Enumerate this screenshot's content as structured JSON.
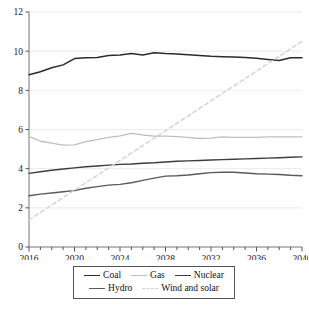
{
  "chart_data": {
    "type": "line",
    "title": "",
    "subtitle": "",
    "xlabel": "",
    "ylabel": "",
    "xlim": [
      2016,
      2040
    ],
    "ylim": [
      0,
      12
    ],
    "grid": true,
    "grid_axis": "y",
    "legend_position": "bottom",
    "y_ticks": [
      0,
      2,
      4,
      6,
      8,
      10,
      12
    ],
    "y_tick_labels": [
      "0",
      "2",
      "4",
      "6",
      "8",
      "10",
      "12"
    ],
    "x_ticks": [
      2016,
      2020,
      2024,
      2028,
      2032,
      2036,
      2040
    ],
    "x_tick_labels": [
      "2016",
      "2020",
      "2024",
      "2028",
      "2032",
      "2036",
      "2040"
    ],
    "x_minor_tick_step": 1,
    "x": [
      2016,
      2017,
      2018,
      2019,
      2020,
      2021,
      2022,
      2023,
      2024,
      2025,
      2026,
      2027,
      2028,
      2029,
      2030,
      2031,
      2032,
      2033,
      2034,
      2035,
      2036,
      2037,
      2038,
      2039,
      2040
    ],
    "series": [
      {
        "name": "Coal",
        "color": "#2b2b2b",
        "width": 1.5,
        "dash": "none",
        "values": [
          8.8,
          8.95,
          9.15,
          9.3,
          9.62,
          9.66,
          9.68,
          9.78,
          9.8,
          9.88,
          9.8,
          9.92,
          9.88,
          9.86,
          9.82,
          9.78,
          9.74,
          9.72,
          9.7,
          9.68,
          9.64,
          9.58,
          9.52,
          9.66,
          9.66
        ]
      },
      {
        "name": "Gas",
        "color": "#bfbfbf",
        "width": 1.3,
        "dash": "none",
        "values": [
          5.65,
          5.4,
          5.3,
          5.2,
          5.22,
          5.38,
          5.48,
          5.6,
          5.68,
          5.8,
          5.72,
          5.66,
          5.66,
          5.64,
          5.6,
          5.54,
          5.56,
          5.62,
          5.6,
          5.6,
          5.6,
          5.62,
          5.62,
          5.62,
          5.62
        ]
      },
      {
        "name": "Nuclear",
        "color": "#3d3d3d",
        "width": 1.4,
        "dash": "none",
        "values": [
          3.76,
          3.84,
          3.92,
          3.98,
          4.04,
          4.1,
          4.14,
          4.18,
          4.22,
          4.24,
          4.28,
          4.3,
          4.34,
          4.38,
          4.4,
          4.42,
          4.44,
          4.46,
          4.48,
          4.5,
          4.52,
          4.54,
          4.56,
          4.58,
          4.6
        ]
      },
      {
        "name": "Hydro",
        "color": "#5a5a5a",
        "width": 1.4,
        "dash": "none",
        "values": [
          2.62,
          2.7,
          2.76,
          2.82,
          2.88,
          3.0,
          3.08,
          3.16,
          3.2,
          3.28,
          3.4,
          3.52,
          3.62,
          3.64,
          3.68,
          3.74,
          3.8,
          3.82,
          3.82,
          3.78,
          3.74,
          3.72,
          3.7,
          3.66,
          3.64
        ]
      },
      {
        "name": "Wind and solar",
        "color": "#d2d2d2",
        "width": 1.4,
        "dash": "4 3",
        "values": [
          1.38,
          1.76,
          2.14,
          2.52,
          2.9,
          3.28,
          3.66,
          4.04,
          4.42,
          4.8,
          5.18,
          5.56,
          5.94,
          6.32,
          6.7,
          7.08,
          7.46,
          7.84,
          8.22,
          8.6,
          8.98,
          9.36,
          9.74,
          10.12,
          10.5
        ]
      }
    ]
  },
  "legend": {
    "rows": [
      [
        {
          "label": "Coal",
          "color": "#2b2b2b",
          "dash": "solid"
        },
        {
          "label": "Gas",
          "color": "#bfbfbf",
          "dash": "solid"
        },
        {
          "label": "Nuclear",
          "color": "#3d3d3d",
          "dash": "solid"
        }
      ],
      [
        {
          "label": "Hydro",
          "color": "#5a5a5a",
          "dash": "solid"
        },
        {
          "label": "Wind and solar",
          "color": "#d2d2d2",
          "dash": "dashed"
        }
      ]
    ]
  },
  "axes": {
    "axis_color": "#777777",
    "grid_color": "#e6e6e6",
    "tick_color": "#555555"
  }
}
